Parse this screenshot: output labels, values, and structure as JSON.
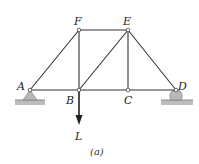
{
  "diagram": {
    "type": "truss",
    "caption": "(a)",
    "joints": {
      "A": {
        "label": "A",
        "x": 30,
        "y": 90
      },
      "B": {
        "label": "B",
        "x": 79,
        "y": 90
      },
      "C": {
        "label": "C",
        "x": 128,
        "y": 90
      },
      "D": {
        "label": "D",
        "x": 176,
        "y": 90
      },
      "E": {
        "label": "E",
        "x": 128,
        "y": 30
      },
      "F": {
        "label": "F",
        "x": 79,
        "y": 30
      }
    },
    "members": [
      "AB",
      "BC",
      "CD",
      "AF",
      "FB",
      "FE",
      "BE",
      "EC",
      "ED"
    ],
    "load": {
      "label": "L",
      "at": "B",
      "direction": "down"
    },
    "supports": {
      "left": {
        "at": "A",
        "kind": "pin"
      },
      "right": {
        "at": "D",
        "kind": "roller"
      }
    },
    "colors": {
      "member": "#333333",
      "joint_fill": "#ffffff",
      "support_fill": "#b8b8b8",
      "ground": "#a0a0a0"
    }
  }
}
